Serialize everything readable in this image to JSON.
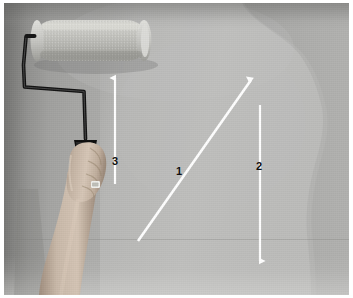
{
  "figure": {
    "border_color": "#ffffff",
    "width": 353,
    "height": 298
  },
  "scene": {
    "subject": "hand holding a paint roller against a wall",
    "wall": {
      "base_color": "#b0b0ae",
      "shadow_color": "#8e8e8c",
      "painted_patch_color": "#bdbdbb",
      "painted_patch_description": "freshly rolled lighter area with wavy right edge"
    },
    "roller": {
      "sleeve_color": "#c9c9c4",
      "frame_color": "#1a1a1a",
      "handle_color": "#111111"
    },
    "hand": {
      "skin_color": "#c8b7a8",
      "description": "left hand gripping roller handle, forearm extending down"
    }
  },
  "annotations": {
    "arrow_color": "#ffffff",
    "label_color": "#101010",
    "items": [
      {
        "id": "arrow-1",
        "label": "1",
        "direction": "diagonal-up-right",
        "head": "single",
        "x1": 134,
        "y1": 238,
        "x2": 248,
        "y2": 75
      },
      {
        "id": "arrow-2",
        "label": "2",
        "direction": "vertical-down",
        "head": "single",
        "x1": 256,
        "y1": 102,
        "x2": 256,
        "y2": 263
      },
      {
        "id": "arrow-3",
        "label": "3",
        "direction": "vertical-up",
        "head": "single",
        "x1": 111,
        "y1": 181,
        "x2": 111,
        "y2": 70
      }
    ]
  }
}
